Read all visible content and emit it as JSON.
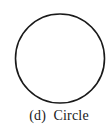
{
  "figure": {
    "caption": "(d)  Circle",
    "shape": {
      "type": "circle",
      "cx": 60,
      "cy": 58.5,
      "r": 44.5,
      "stroke": "#1a1a1a",
      "stroke_width": 1.6,
      "fill": "none"
    }
  }
}
